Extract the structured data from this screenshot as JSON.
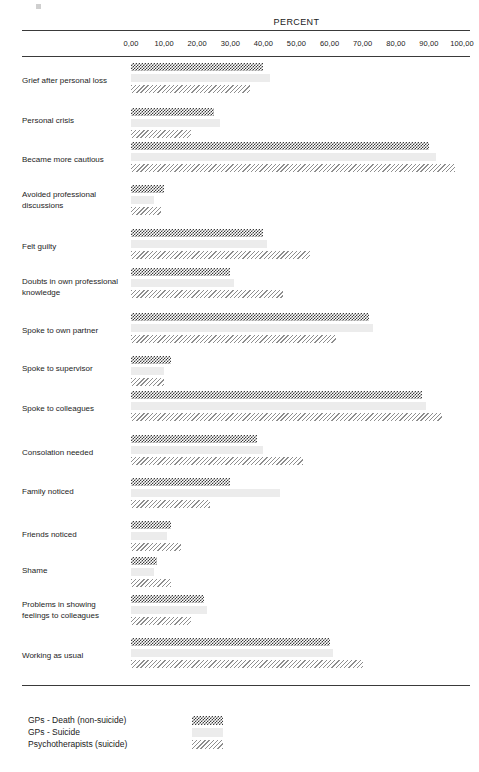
{
  "chart_data": {
    "type": "bar",
    "orientation": "horizontal",
    "title": "",
    "xlabel": "PERCENT",
    "ylabel": "",
    "xlim": [
      0,
      100
    ],
    "grid": false,
    "legend_position": "bottom-left",
    "tick_labels": [
      "0,00",
      "10,00",
      "20,00",
      "30,00",
      "40,00",
      "50,00",
      "60,00",
      "70,00",
      "80,00",
      "90,00",
      "100,00"
    ],
    "tick_values": [
      0,
      10,
      20,
      30,
      40,
      50,
      60,
      70,
      80,
      90,
      100
    ],
    "categories": [
      "Grief after personal loss",
      "Personal crisis",
      "Became more cautious",
      "Avoided professional discussions",
      "Felt guilty",
      "Doubts in own professional knowledge",
      "Spoke to own partner",
      "Spoke to supervisor",
      "Spoke to colleagues",
      "Consolation needed",
      "Family noticed",
      "Friends noticed",
      "Shame",
      "Problems in showing feelings to colleagues",
      "Working as usual"
    ],
    "series": [
      {
        "name": "GPs - Death (non-suicide)",
        "pattern": "dark-checkerboard",
        "color": "#3c3c3c",
        "values": [
          40,
          25,
          90,
          10,
          40,
          30,
          72,
          12,
          88,
          38,
          30,
          12,
          8,
          22,
          60
        ]
      },
      {
        "name": "GPs - Suicide",
        "pattern": "light-solid",
        "color": "#ececec",
        "values": [
          42,
          27,
          92,
          7,
          41,
          31,
          73,
          10,
          89,
          40,
          45,
          11,
          7,
          23,
          61
        ]
      },
      {
        "name": "Psychotherapists (suicide)",
        "pattern": "diagonal-hatch",
        "color": "#8e8e8e",
        "values": [
          36,
          18,
          98,
          9,
          54,
          46,
          62,
          10,
          94,
          52,
          24,
          15,
          12,
          18,
          70
        ]
      }
    ]
  },
  "axis": {
    "percent_label": "PERCENT"
  },
  "legend": {
    "entries": [
      {
        "label": "GPs - Death (non-suicide)"
      },
      {
        "label": "GPs - Suicide"
      },
      {
        "label": "Psychotherapists (suicide)"
      }
    ]
  }
}
